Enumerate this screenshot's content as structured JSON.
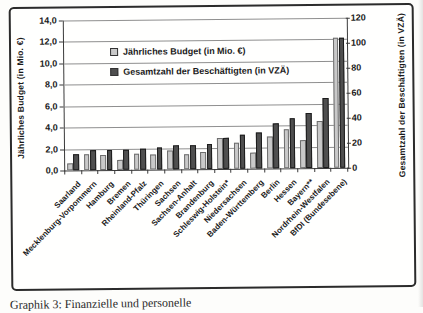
{
  "figure": {
    "caption": "Graphik 3: Finanzielle und personelle"
  },
  "chart_data": {
    "type": "bar",
    "title": "",
    "categories": [
      "Saarland",
      "Mecklenburg-Vorpommern",
      "Hamburg",
      "Bremen",
      "Rheinland-Pfalz",
      "Thüringen",
      "Sachsen",
      "Sachsen-Anhalt",
      "Brandenburg",
      "Schleswig-Holstein*",
      "Niedersachsen",
      "Baden-Württemberg",
      "Berlin",
      "Hessen",
      "Bayern**",
      "Nordrhein-Westfalen",
      "BfDI (Bundesebene)"
    ],
    "series": [
      {
        "name": "Jährliches Budget (in Mio. €)",
        "axis": "left",
        "color": "#c9c9c9",
        "values": [
          0.7,
          1.5,
          1.4,
          0.9,
          1.5,
          1.4,
          1.8,
          1.4,
          1.6,
          2.9,
          2.4,
          1.5,
          3.0,
          3.6,
          2.6,
          4.4,
          12.1
        ]
      },
      {
        "name": "Gesamtzahl der Beschäftigten (in VZÄ)",
        "axis": "right",
        "color": "#4f4f4f",
        "values": [
          13,
          16,
          16,
          16,
          17,
          18,
          19,
          19,
          20,
          25,
          27,
          29,
          36,
          40,
          44,
          56,
          104
        ]
      }
    ],
    "left_axis": {
      "label": "Jährliches Budget (in Mio. €)",
      "min": 0,
      "max": 14,
      "tick_labels": [
        "14,0",
        "12,0",
        "10,0",
        "8,0",
        "6,0",
        "4,0",
        "2,0",
        "0,0"
      ]
    },
    "right_axis": {
      "label": "Gesamtzahl der Beschäftigten (in VZÄ)",
      "min": 0,
      "max": 120,
      "tick_labels": [
        "120",
        "100",
        "80",
        "60",
        "40",
        "20",
        "0"
      ]
    },
    "grid": true,
    "legend_position": "inside-top-left"
  }
}
